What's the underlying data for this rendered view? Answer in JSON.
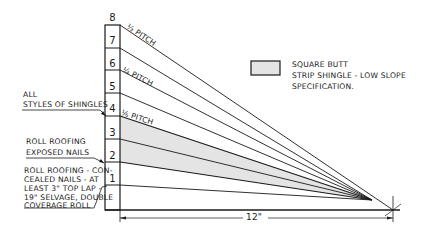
{
  "diagram": {
    "scale_numbers": [
      "8",
      "7",
      "6",
      "5",
      "4",
      "3",
      "2",
      "1"
    ],
    "pitch_labels": {
      "third": "⅓ PITCH",
      "quarter": "¼ PITCH",
      "sixth": "⅙ PITCH"
    },
    "legend": {
      "line1": "SQUARE BUTT",
      "line2": "STRIP SHINGLE - LOW SLOPE",
      "line3": "SPECIFICATION.",
      "swatch_color": "#e4e4e4"
    },
    "callouts": {
      "all_styles": {
        "line1": "ALL",
        "line2": "STYLES OF SHINGLES"
      },
      "roll_exposed": {
        "line1": "ROLL ROOFING",
        "line2": "EXPOSED NAILS"
      },
      "roll_concealed": {
        "line1": "ROLL ROOFING - CON-",
        "line2": "CEALED NAILS - AT",
        "line3": "LEAST 3\" TOP LAP -",
        "line4": "19\" SELVAGE, DOUBLE",
        "line5": "COVERAGE ROLL"
      }
    },
    "dimension": "12\"",
    "colors": {
      "ink": "#1a1a1a",
      "shade": "#e4e4e4"
    }
  }
}
